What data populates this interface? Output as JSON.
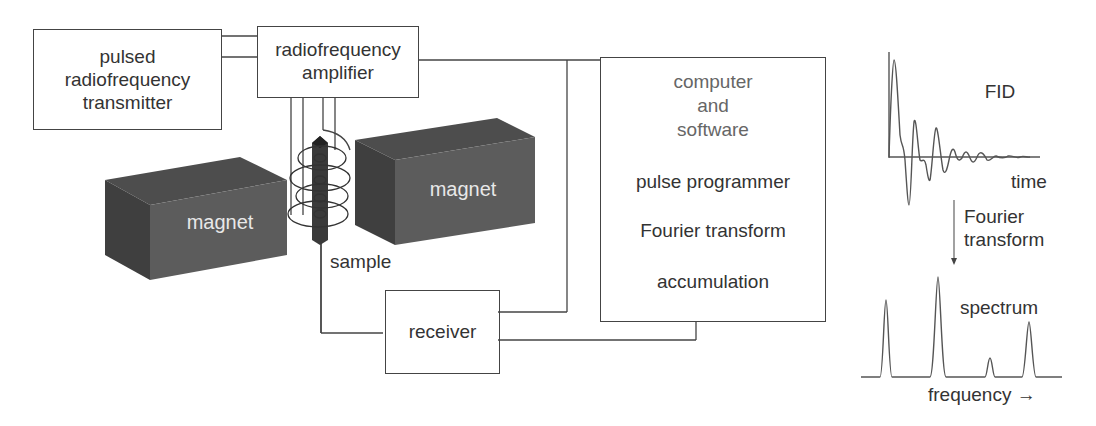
{
  "blocks": {
    "transmitter": {
      "lines": [
        "pulsed",
        "radiofrequency",
        "transmitter"
      ]
    },
    "amplifier": {
      "lines": [
        "radiofrequency",
        "amplifier"
      ]
    },
    "computer": {
      "header_lines": [
        "computer",
        "and",
        "software"
      ],
      "functions": [
        "pulse programmer",
        "Fourier transform",
        "accumulation"
      ]
    },
    "receiver": {
      "label": "receiver"
    }
  },
  "components": {
    "magnet_left": {
      "label": "magnet"
    },
    "magnet_right": {
      "label": "magnet"
    },
    "sample": {
      "label": "sample"
    }
  },
  "fid_plot": {
    "title": "FID",
    "xlabel": "time"
  },
  "transform_arrow": {
    "lines": [
      "Fourier",
      "transform"
    ]
  },
  "spectrum_plot": {
    "title": "spectrum",
    "xlabel": "frequency",
    "xlabel_arrow": "→"
  },
  "colors": {
    "line": "#444444",
    "magnet": "#5a5a5a",
    "magnet_top": "#4a4a4a",
    "magnet_side": "#3e3e3e",
    "sample": "#3a3a3a",
    "magnet_text": "#e8e8e8"
  }
}
